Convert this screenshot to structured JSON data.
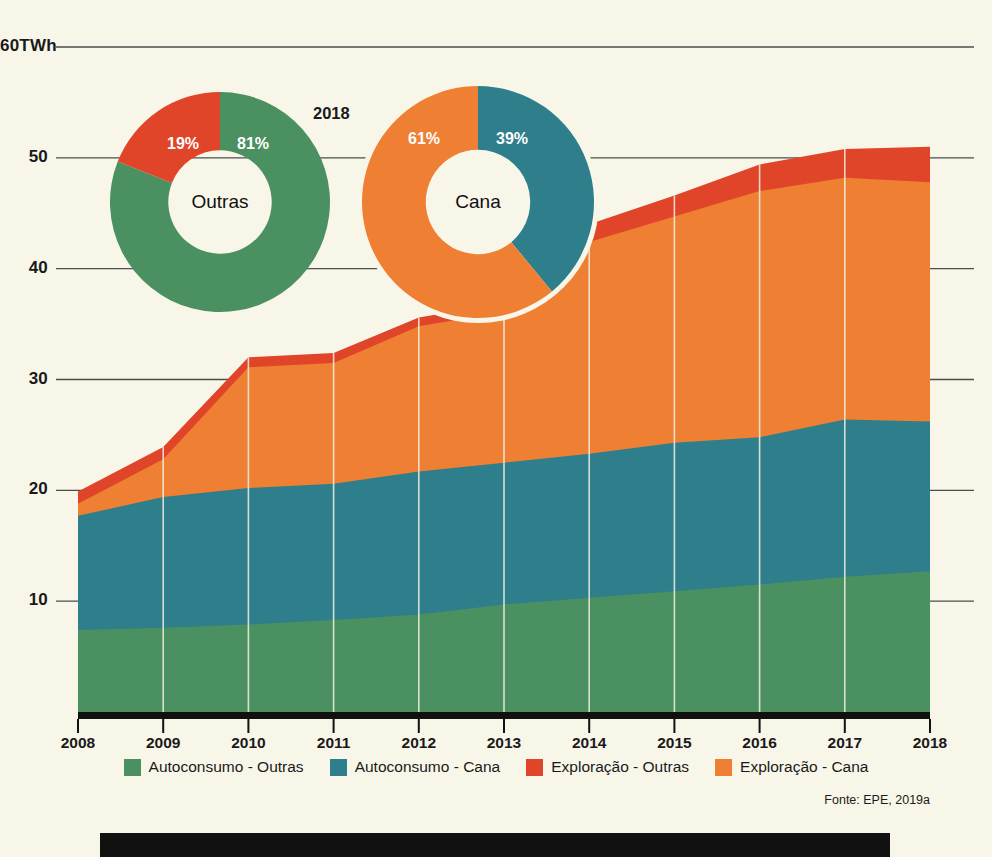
{
  "chart_data": {
    "type": "area",
    "title": "",
    "xlabel": "",
    "ylabel": "TWh",
    "ylim": [
      0,
      60
    ],
    "yticks": [
      10,
      20,
      30,
      40,
      50,
      60
    ],
    "ytick_labels": [
      "10",
      "20",
      "30",
      "40",
      "50",
      "60TWh"
    ],
    "grid": true,
    "legend_position": "bottom",
    "stacked": true,
    "categories": [
      2008,
      2009,
      2010,
      2011,
      2012,
      2013,
      2014,
      2015,
      2016,
      2017,
      2018
    ],
    "series": [
      {
        "name": "Autoconsumo - Outras",
        "color": "#4a9060",
        "values": [
          7.4,
          7.6,
          7.9,
          8.3,
          8.8,
          9.7,
          10.3,
          10.9,
          11.5,
          12.2,
          12.7
        ]
      },
      {
        "name": "Autoconsumo - Cana",
        "color": "#2e7e8c",
        "values": [
          10.3,
          11.8,
          12.3,
          12.3,
          12.9,
          12.8,
          13.0,
          13.4,
          13.3,
          14.2,
          13.5
        ]
      },
      {
        "name": "Exploração - Cana",
        "color": "#ef8033",
        "values": [
          1.1,
          3.4,
          10.9,
          10.9,
          13.1,
          13.6,
          19.1,
          20.4,
          22.2,
          21.8,
          21.6
        ]
      },
      {
        "name": "Exploração - Outras",
        "color": "#e04529",
        "values": [
          1.1,
          1.1,
          0.9,
          0.9,
          0.8,
          0.8,
          1.6,
          1.9,
          2.4,
          2.6,
          3.2
        ]
      }
    ],
    "totals": [
      19.9,
      23.9,
      32.0,
      32.4,
      35.6,
      36.9,
      44.0,
      46.6,
      49.4,
      50.8,
      51.0
    ],
    "source": "Fonte: EPE, 2019a"
  },
  "donuts": {
    "year": "2018",
    "items": [
      {
        "center_label": "Outras",
        "slices": [
          {
            "label": "81%",
            "value": 81,
            "color": "#4a9060",
            "series": "Autoconsumo - Outras"
          },
          {
            "label": "19%",
            "value": 19,
            "color": "#e04529",
            "series": "Exploração - Outras"
          }
        ]
      },
      {
        "center_label": "Cana",
        "slices": [
          {
            "label": "39%",
            "value": 39,
            "color": "#2e7e8c",
            "series": "Autoconsumo - Cana"
          },
          {
            "label": "61%",
            "value": 61,
            "color": "#ef8033",
            "series": "Exploração - Cana"
          }
        ]
      }
    ]
  },
  "legend": {
    "items": [
      {
        "label": "Autoconsumo - Outras",
        "color": "#4a9060"
      },
      {
        "label": "Autoconsumo - Cana",
        "color": "#2e7e8c"
      },
      {
        "label": "Exploração - Outras",
        "color": "#e04529"
      },
      {
        "label": "Exploração - Cana",
        "color": "#ef8033"
      }
    ]
  },
  "source_text": "Fonte: EPE, 2019a",
  "colors": {
    "background": "#f8f6e9",
    "axis": "#111111",
    "gridline": "#4d4d4d",
    "plot_gridline": "#f3f0e2"
  }
}
